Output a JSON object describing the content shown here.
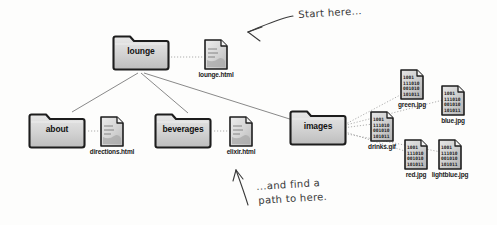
{
  "diagram": {
    "background_color": "#fdfdfc",
    "line_color": "#6b6b6b",
    "folder_fill": "#d8d8d8",
    "file_fill": "#d4d4d4",
    "ink_color": "#3a3a3a"
  },
  "folders": {
    "lounge": {
      "label": "lounge"
    },
    "about": {
      "label": "about"
    },
    "beverages": {
      "label": "beverages"
    },
    "images": {
      "label": "images"
    }
  },
  "files": {
    "lounge_html": {
      "label": "lounge.html",
      "kind": "html-file-icon"
    },
    "directions_html": {
      "label": "directions.html",
      "kind": "html-file-icon"
    },
    "elixir_html": {
      "label": "elixir.html",
      "kind": "html-file-icon"
    },
    "drinks_gif": {
      "label": "drinks.gif",
      "kind": "image-file-icon"
    },
    "green_jpg": {
      "label": "green.jpg",
      "kind": "image-file-icon"
    },
    "blue_jpg": {
      "label": "blue.jpg",
      "kind": "image-file-icon"
    },
    "red_jpg": {
      "label": "red.jpg",
      "kind": "image-file-icon"
    },
    "lightblue_jpg": {
      "label": "lightblue.jpg",
      "kind": "image-file-icon"
    }
  },
  "image_icon_text": {
    "line1": "1001",
    "line2": "111010",
    "line3": "001010",
    "line4": "101011"
  },
  "annotations": {
    "start_here": "Start here...",
    "find_path_line1": "...and find a",
    "find_path_line2": "path to here."
  }
}
